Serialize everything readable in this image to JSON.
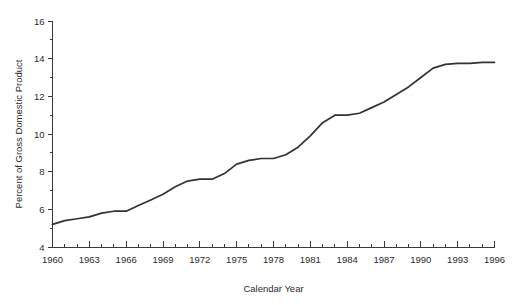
{
  "chart_data": {
    "type": "line",
    "title": "",
    "subtitle": "",
    "xlabel": "Calendar Year",
    "ylabel": "Percent of Gross Domestic Product",
    "xlim": [
      1960,
      1996
    ],
    "ylim": [
      4,
      16
    ],
    "grid": false,
    "legend": null,
    "legend_position": "none",
    "line_color": "#33322f",
    "axis_color": "#3a3a3a",
    "background_color": "#ffffff",
    "x_major_ticks": [
      1960,
      1963,
      1966,
      1969,
      1972,
      1975,
      1978,
      1981,
      1984,
      1987,
      1990,
      1993,
      1996
    ],
    "x_tick_labels": [
      "1960",
      "1963",
      "1966",
      "1969",
      "1972",
      "1975",
      "1978",
      "1981",
      "1984",
      "1987",
      "1990",
      "1993",
      "1996"
    ],
    "x_minor_step": 1,
    "y_major_ticks": [
      4,
      6,
      8,
      10,
      12,
      14,
      16
    ],
    "y_tick_labels": [
      "4",
      "6",
      "8",
      "10",
      "12",
      "14",
      "16"
    ],
    "y_minor_ticks": [
      5,
      7,
      9,
      11,
      13,
      15
    ],
    "series": [
      {
        "name": "Percent of Gross Domestic Product",
        "x": [
          1960,
          1961,
          1962,
          1963,
          1964,
          1965,
          1966,
          1967,
          1968,
          1969,
          1970,
          1971,
          1972,
          1973,
          1974,
          1975,
          1976,
          1977,
          1978,
          1979,
          1980,
          1981,
          1982,
          1983,
          1984,
          1985,
          1986,
          1987,
          1988,
          1989,
          1990,
          1991,
          1992,
          1993,
          1994,
          1995,
          1996
        ],
        "values": [
          5.2,
          5.4,
          5.5,
          5.6,
          5.8,
          5.9,
          5.9,
          6.2,
          6.5,
          6.8,
          7.2,
          7.5,
          7.6,
          7.6,
          7.9,
          8.4,
          8.6,
          8.7,
          8.7,
          8.9,
          9.3,
          9.9,
          10.6,
          11.0,
          11.0,
          11.1,
          11.4,
          11.7,
          12.1,
          12.5,
          13.0,
          13.5,
          13.7,
          13.75,
          13.75,
          13.8,
          13.8
        ]
      }
    ]
  }
}
